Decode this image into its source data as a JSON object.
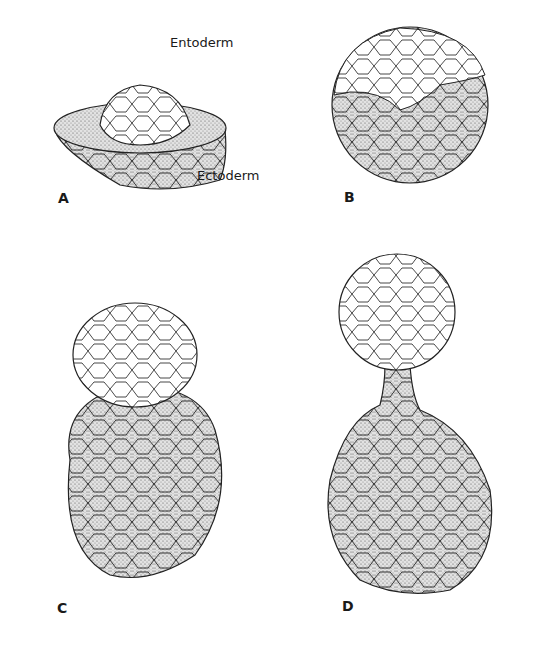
{
  "figure": {
    "panels": [
      {
        "id": "A",
        "label": "A",
        "annotations": [
          "Entoderm",
          "Ectoderm"
        ]
      },
      {
        "id": "B",
        "label": "B"
      },
      {
        "id": "C",
        "label": "C"
      },
      {
        "id": "D",
        "label": "D"
      }
    ],
    "colors": {
      "ink": "#2a2a2a",
      "stipple": "#9a9a9a",
      "background": "#ffffff"
    }
  }
}
